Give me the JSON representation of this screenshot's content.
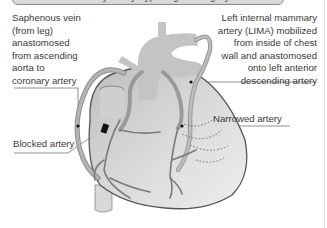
{
  "title": {
    "text": "Coronary artery bypass graft surgery",
    "visible": "partially cut off at top"
  },
  "labels": {
    "saphenous_vein": "Saphenous vein\n(from leg)\nanastomosed\nfrom ascending\naorta to\ncoronary artery",
    "lima": "Left internal mammary\nartery (LIMA) mobilized\nfrom inside of chest\nwall and anastomosed\nonto left anterior\ndescending artery",
    "narrowed_artery": "Narrowed artery",
    "blocked_artery": "Blocked artery"
  },
  "colors": {
    "background": "#ffffff",
    "heart_fill": "#d0d0d0",
    "vessel": "#a8a8a8",
    "outline": "#555555",
    "block": "#111111",
    "leader_line": "#777777"
  }
}
